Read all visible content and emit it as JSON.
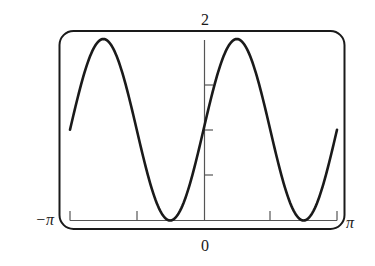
{
  "chart_data": {
    "type": "line",
    "title": "",
    "function": "y = 1 + sin(2x)",
    "xlabel": "",
    "ylabel": "",
    "xlim": [
      -3.14159,
      3.14159
    ],
    "ylim": [
      0,
      2
    ],
    "x_tick_labels": {
      "min": "−π",
      "zero": "0",
      "max": "π"
    },
    "y_tick_labels": {
      "max": "2"
    },
    "x_ticks": [
      -3.14159,
      -1.5708,
      0,
      1.5708,
      3.14159
    ],
    "y_ticks": [
      0.5,
      1,
      1.5
    ],
    "grid": false,
    "legend": null,
    "series": [
      {
        "name": "1 + sin(2x)",
        "x": [
          -3.1416,
          -2.7489,
          -2.3562,
          -1.9635,
          -1.5708,
          -1.1781,
          -0.7854,
          -0.3927,
          0,
          0.3927,
          0.7854,
          1.1781,
          1.5708,
          1.9635,
          2.3562,
          2.7489,
          3.1416
        ],
        "y": [
          1.0,
          1.707,
          2.0,
          1.707,
          1.0,
          0.293,
          0.0,
          0.293,
          1.0,
          1.707,
          2.0,
          1.707,
          1.0,
          0.293,
          0.0,
          0.293,
          1.0
        ]
      }
    ],
    "colors": {
      "curve": "#1a1a1a",
      "frame": "#1a1a1a",
      "axes": "#555555"
    }
  }
}
